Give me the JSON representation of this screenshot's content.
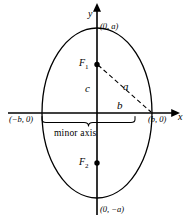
{
  "figure": {
    "type": "ellipse-diagram",
    "colors": {
      "stroke": "#000000",
      "background": "#ffffff",
      "text": "#000000"
    },
    "axes": {
      "x_label": "x",
      "y_label": "y",
      "origin": {
        "x": 97,
        "y": 113
      }
    },
    "ellipse": {
      "center": {
        "x": 97,
        "y": 113
      },
      "semi_minor_x": 55,
      "semi_major_y": 85,
      "orientation": "vertical"
    },
    "vertices": [
      {
        "name": "top-vertex",
        "label": "(0, a)"
      },
      {
        "name": "bottom-vertex",
        "label": "(0, −a)"
      },
      {
        "name": "left-covertex",
        "label": "(−b, 0)"
      },
      {
        "name": "right-covertex",
        "label": "(b, 0)"
      }
    ],
    "foci": [
      {
        "name": "focus-1",
        "label": "F",
        "sub": "1"
      },
      {
        "name": "focus-2",
        "label": "F",
        "sub": "2"
      }
    ],
    "segments": [
      {
        "name": "segment-a",
        "label": "a",
        "style": "dashed",
        "from": "focus-1",
        "to": "right-covertex"
      },
      {
        "name": "segment-c",
        "label": "c",
        "style": "solid",
        "from": "origin",
        "to": "focus-1"
      },
      {
        "name": "segment-b",
        "label": "b",
        "style": "solid",
        "from": "origin",
        "to": "right-covertex"
      }
    ],
    "annotations": [
      {
        "name": "minor-axis-brace-label",
        "label": "minor axis"
      }
    ]
  }
}
